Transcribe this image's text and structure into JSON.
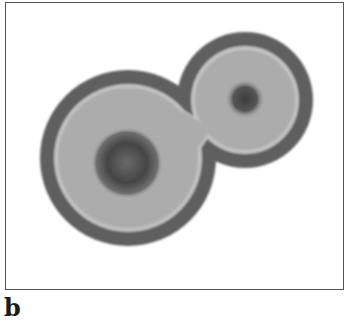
{
  "figure": {
    "panel_label": "b",
    "colors": {
      "background": "#ffffff",
      "rim": "#5e5e5e",
      "body": "#ababab",
      "highlight_ring": "#c4c4c4",
      "core": "#4a4a4a",
      "frame": "#555555"
    },
    "shapes": {
      "large_domain": {
        "cx": 128,
        "cy": 158,
        "r": 88
      },
      "small_domain": {
        "cx": 245,
        "cy": 100,
        "r": 68
      },
      "large_core": {
        "cx": 127,
        "cy": 163,
        "r": 33
      },
      "small_core": {
        "cx": 245,
        "cy": 99,
        "r": 18
      }
    }
  }
}
